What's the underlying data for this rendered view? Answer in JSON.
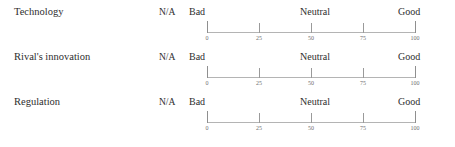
{
  "survey": {
    "na_label": "N/A",
    "anchors": {
      "low": "Bad",
      "mid": "Neutral",
      "high": "Good"
    },
    "tick_values": [
      "0",
      "25",
      "50",
      "75",
      "100"
    ],
    "scale_min": 0,
    "scale_max": 100,
    "colors": {
      "text": "#2e2e2e",
      "axis_line": "#b4b4b4",
      "tick_mark": "#9a9a9a",
      "tick_label": "#6e6e6e",
      "background": "#ffffff"
    },
    "rows": [
      {
        "label": "Technology"
      },
      {
        "label": "Rival's innovation"
      },
      {
        "label": "Regulation"
      }
    ]
  }
}
